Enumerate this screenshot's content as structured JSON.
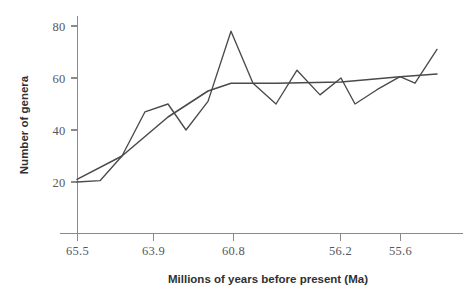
{
  "chart_data": {
    "type": "line",
    "title": "",
    "xlabel": "Millions of years before present (Ma)",
    "ylabel": "Number of genera",
    "grid": false,
    "legend": "none",
    "xlim": [
      65.5,
      54.9
    ],
    "ylim": [
      0,
      84
    ],
    "x_tick_labels": [
      "65.5",
      "63.9",
      "60.8",
      "56.2",
      "55.6"
    ],
    "x_tick_pixels": [
      77,
      153,
      233,
      340,
      400
    ],
    "y_tick_labels": [
      "20",
      "40",
      "60",
      "80"
    ],
    "y_tick_values": [
      20,
      40,
      60,
      80
    ],
    "axis_note": "x axis is reversed time; tick labels are non-uniformly spaced sample ages",
    "series": [
      {
        "name": "Number of genera",
        "style": "jagged observed series",
        "x_pixels": [
          77,
          100,
          122,
          145,
          168,
          186,
          208,
          231,
          253,
          276,
          297,
          320,
          341,
          355,
          377,
          400,
          415,
          437
        ],
        "values": [
          20,
          20.5,
          30,
          47,
          50,
          40,
          51,
          78,
          58,
          50,
          63,
          53.5,
          60,
          50,
          55.5,
          60.5,
          58,
          71
        ]
      },
      {
        "name": "Smoothed trend",
        "style": "smoothed trend line",
        "x_pixels": [
          77,
          122,
          168,
          208,
          231,
          276,
          341,
          400,
          437
        ],
        "values": [
          21,
          30,
          45,
          55,
          58,
          58,
          58.5,
          60.5,
          61.5
        ]
      }
    ]
  }
}
